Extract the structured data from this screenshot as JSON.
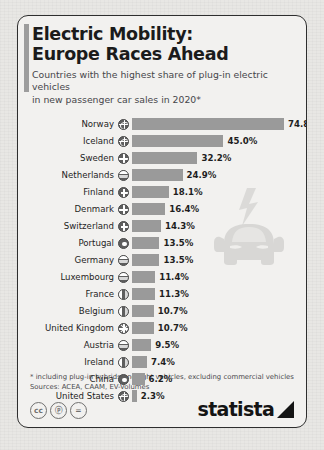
{
  "header": {
    "title_line1": "Electric Mobility:",
    "title_line2": "Europe Races Ahead",
    "subtitle_line1": "Countries with the highest share of plug-in electric vehicles",
    "subtitle_line2": "in new passenger car sales in 2020*"
  },
  "chart_data": {
    "type": "bar",
    "title": "Electric Mobility: Europe Races Ahead",
    "subtitle": "Countries with the highest share of plug-in electric vehicles in new passenger car sales in 2020*",
    "orientation": "horizontal",
    "xlabel": "",
    "ylabel": "",
    "xlim": [
      0,
      74.8
    ],
    "grid": false,
    "legend": null,
    "unit": "%",
    "categories": [
      "Norway",
      "Iceland",
      "Sweden",
      "Netherlands",
      "Finland",
      "Denmark",
      "Switzerland",
      "Portugal",
      "Germany",
      "Luxembourg",
      "France",
      "Belgium",
      "United Kingdom",
      "Austria",
      "Ireland",
      "China",
      "United States"
    ],
    "values": [
      74.8,
      45.0,
      32.2,
      24.9,
      18.1,
      16.4,
      14.3,
      13.5,
      13.5,
      11.4,
      11.3,
      10.7,
      10.7,
      9.5,
      7.4,
      6.2,
      2.3
    ],
    "labels": [
      "74.8%",
      "45.0%",
      "32.2%",
      "24.9%",
      "18.1%",
      "16.4%",
      "14.3%",
      "13.5%",
      "13.5%",
      "11.4%",
      "11.3%",
      "10.7%",
      "10.7%",
      "9.5%",
      "7.4%",
      "6.2%",
      "2.3%"
    ],
    "flag_styles": [
      "globe",
      "globe",
      "nordic",
      "band",
      "cross",
      "nordic",
      "cross",
      "dot",
      "band",
      "band",
      "vert",
      "vert",
      "union",
      "band",
      "vert",
      "dot",
      "globe"
    ],
    "bar_color": "#9a9a9a"
  },
  "decor": {
    "car_icon": "electric-car-front-icon",
    "bolt_icon": "lightning-bolt-icon"
  },
  "footer": {
    "note_1": "* including plug-in hybrids and light vehicles, excluding commercial vehicles",
    "note_2": "Sources: ACEA, CAAM, EV-Volumes",
    "cc_badges": [
      "cc",
      "ⓟ",
      "="
    ],
    "brand": "statista"
  },
  "colors": {
    "bar": "#9a9a9a",
    "card_bg": "#f2f1ef",
    "page_bg": "#e8e7e4",
    "text": "#1e1e1e",
    "accent": "#9d9d9d"
  }
}
